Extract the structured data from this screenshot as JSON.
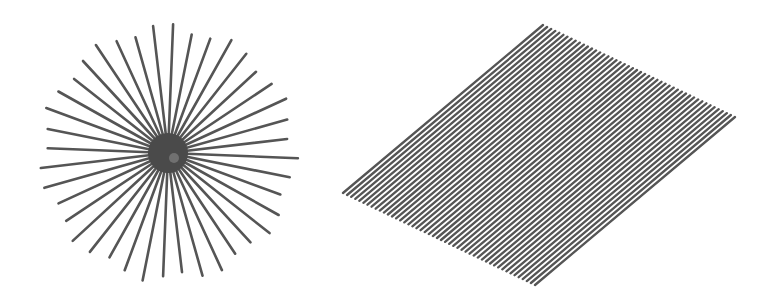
{
  "figures": [
    {
      "name": "radial-starburst",
      "description": "Lines radiating from a common center",
      "center": [
        168,
        153
      ],
      "radius": 130,
      "spoke_count": 40,
      "hub_radius": 20,
      "line_color": "#555555",
      "hub_color": "#4a4a4a"
    },
    {
      "name": "parallel-line-parallelogram",
      "description": "Parallel diagonal lines filling a tilted parallelogram",
      "corners": {
        "left": [
          343,
          193
        ],
        "top": [
          543,
          25
        ],
        "right": [
          737,
          117
        ],
        "bottom": [
          535,
          285
        ]
      },
      "line_count": 48,
      "line_color": "#555555"
    }
  ]
}
